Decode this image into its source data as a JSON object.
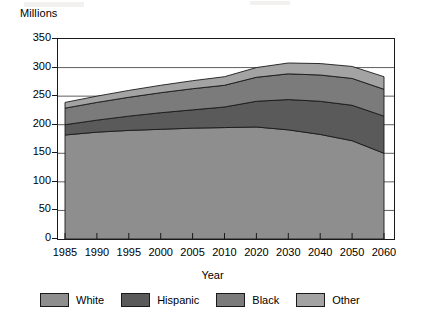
{
  "figure": {
    "y_unit_label": "Millions",
    "x_axis_title": "Year"
  },
  "legend": {
    "items": [
      {
        "label": "White",
        "color": "#8e8e8e"
      },
      {
        "label": "Hispanic",
        "color": "#5a5a5a"
      },
      {
        "label": "Black",
        "color": "#7b7b7b"
      },
      {
        "label": "Other",
        "color": "#a3a3a3"
      }
    ]
  },
  "colors": {
    "white_band": "#8e8e8e",
    "hispanic_band": "#5a5a5a",
    "black_band": "#7b7b7b",
    "other_band": "#a3a3a3",
    "axis": "#1a1a1a",
    "gridline": "#4d4d4d",
    "background": "#ffffff"
  },
  "chart_data": {
    "type": "area",
    "stacked": true,
    "title": "",
    "subtitle": "",
    "xlabel": "Year",
    "ylabel": "Millions",
    "ylim": [
      0,
      350
    ],
    "yticks": [
      0,
      50,
      100,
      150,
      200,
      250,
      300,
      350
    ],
    "ytick_labels": [
      "0",
      "50",
      "100",
      "150",
      "200",
      "250",
      "300",
      "350"
    ],
    "grid": "horizontal",
    "legend_position": "bottom",
    "x_categorical": true,
    "categories": [
      "1985",
      "1990",
      "1995",
      "2000",
      "2005",
      "2010",
      "2020",
      "2030",
      "2040",
      "2050",
      "2060"
    ],
    "xtick_labels": [
      "1985",
      "1990",
      "1995",
      "2000",
      "2005",
      "2010",
      "2020",
      "2030",
      "2040",
      "2050",
      "2060"
    ],
    "series": [
      {
        "name": "White",
        "color": "#8e8e8e",
        "values": [
          182,
          187,
          190,
          192,
          194,
          195,
          196,
          191,
          183,
          172,
          150
        ]
      },
      {
        "name": "Hispanic",
        "color": "#5a5a5a",
        "values": [
          18,
          21,
          25,
          29,
          32,
          36,
          45,
          53,
          58,
          62,
          65
        ]
      },
      {
        "name": "Black",
        "color": "#7b7b7b",
        "values": [
          29,
          31,
          33,
          35,
          37,
          38,
          42,
          45,
          46,
          47,
          47
        ]
      },
      {
        "name": "Other",
        "color": "#a3a3a3",
        "values": [
          10,
          11,
          12,
          13,
          14,
          15,
          17,
          19,
          20,
          21,
          22
        ]
      }
    ],
    "cumulative_tops": {
      "White": [
        182,
        187,
        190,
        192,
        194,
        195,
        196,
        191,
        183,
        172,
        150
      ],
      "Hispanic": [
        200,
        208,
        215,
        221,
        226,
        231,
        241,
        244,
        241,
        234,
        215
      ],
      "Black": [
        229,
        239,
        248,
        256,
        263,
        269,
        283,
        289,
        287,
        281,
        262
      ],
      "Other": [
        239,
        250,
        260,
        269,
        277,
        284,
        300,
        308,
        307,
        302,
        284
      ]
    },
    "totals": [
      239,
      250,
      260,
      269,
      277,
      284,
      300,
      308,
      307,
      302,
      284
    ]
  }
}
